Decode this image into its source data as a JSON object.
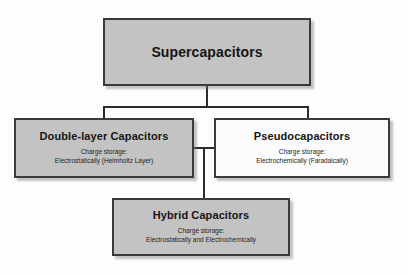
{
  "figure": {
    "nodes": {
      "supercapacitors": {
        "title": "Supercapacitors"
      },
      "double_layer": {
        "title": "Double-layer Capacitors",
        "sub_line1": "Charge storage:",
        "sub_line2": "Electrostatically (Helmholtz Layer)"
      },
      "pseudocapacitors": {
        "title": "Pseudocapacitors",
        "sub_line1": "Charge storage:",
        "sub_line2": "Electrochemically (Faradaically)"
      },
      "hybrid": {
        "title": "Hybrid Capacitors",
        "sub_line1": "Charge storage:",
        "sub_line2": "Electrostatically and Electrochemically"
      }
    },
    "caption": "",
    "colors": {
      "filled_box": "#c3c3c3",
      "plain_box": "#fbfbfb",
      "border": "#3a3a3a",
      "connector": "#2b2b2b",
      "text": "#151515"
    }
  }
}
